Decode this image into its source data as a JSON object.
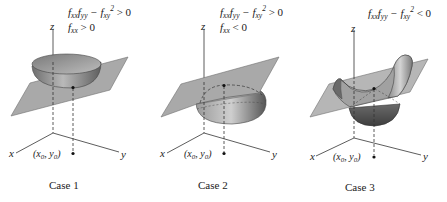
{
  "figure": {
    "colors": {
      "plane_fill": "#a9a9a9",
      "plane_stroke": "#6a6a6a",
      "surface_dark": "#5a5a5a",
      "surface_mid": "#8c8c8c",
      "surface_light": "#c8c8c8",
      "axis": "#333333",
      "background": "#ffffff"
    },
    "cases": [
      {
        "caption": "Case 1",
        "conditions": [
          {
            "main": "f",
            "sub1": "xx",
            "mid": "f",
            "sub2": "yy",
            "minus": " − f",
            "sub3": "xy",
            "sup": "2",
            "rel": " > 0"
          },
          {
            "main": "f",
            "sub1": "xx",
            "rel": " > 0"
          }
        ],
        "surface": "bowl (relative minimum)",
        "axes": {
          "x": "x",
          "y": "y",
          "z": "z"
        },
        "point_label": {
          "open": "(x",
          "sub_x": "0",
          "sep": ", y",
          "sub_y": "0",
          "close": ")"
        }
      },
      {
        "caption": "Case 2",
        "conditions": [
          {
            "main": "f",
            "sub1": "xx",
            "mid": "f",
            "sub2": "yy",
            "minus": " − f",
            "sub3": "xy",
            "sup": "2",
            "rel": " > 0"
          },
          {
            "main": "f",
            "sub1": "xx",
            "rel": " < 0"
          }
        ],
        "surface": "dome (relative maximum)",
        "axes": {
          "x": "x",
          "y": "y",
          "z": "z"
        },
        "point_label": {
          "open": "(x",
          "sub_x": "0",
          "sep": ", y",
          "sub_y": "0",
          "close": ")"
        }
      },
      {
        "caption": "Case 3",
        "conditions": [
          {
            "main": "f",
            "sub1": "xx",
            "mid": "f",
            "sub2": "yy",
            "minus": " − f",
            "sub3": "xy",
            "sup": "2",
            "rel": " < 0"
          }
        ],
        "surface": "saddle (saddle point)",
        "axes": {
          "x": "x",
          "y": "y",
          "z": "z"
        },
        "point_label": {
          "open": "(x",
          "sub_x": "0",
          "sep": ", y",
          "sub_y": "0",
          "close": ")"
        }
      }
    ]
  }
}
